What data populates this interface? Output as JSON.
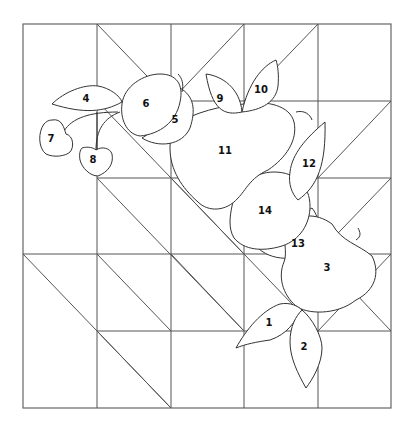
{
  "diagram": {
    "title": "",
    "type": "quilt-block applique pattern",
    "line_color": "#333333",
    "background": "#ffffff",
    "grid": {
      "columns": 5,
      "rows": 5,
      "x": [
        23,
        97,
        171,
        244,
        318,
        391
      ],
      "y": [
        24,
        101,
        178,
        254,
        331,
        408
      ]
    },
    "pieces": [
      {
        "id": "1",
        "label": "1",
        "name": "leaf",
        "x": 269,
        "y": 323
      },
      {
        "id": "2",
        "label": "2",
        "name": "leaf",
        "x": 304,
        "y": 347
      },
      {
        "id": "3",
        "label": "3",
        "name": "apple",
        "x": 327,
        "y": 268
      },
      {
        "id": "4",
        "label": "4",
        "name": "leaf",
        "x": 86,
        "y": 99
      },
      {
        "id": "5",
        "label": "5",
        "name": "plum-back",
        "x": 175,
        "y": 120
      },
      {
        "id": "6",
        "label": "6",
        "name": "plum",
        "x": 146,
        "y": 104
      },
      {
        "id": "7",
        "label": "7",
        "name": "cherry",
        "x": 51,
        "y": 139
      },
      {
        "id": "8",
        "label": "8",
        "name": "cherry",
        "x": 93,
        "y": 160
      },
      {
        "id": "9",
        "label": "9",
        "name": "leaf",
        "x": 220,
        "y": 99
      },
      {
        "id": "10",
        "label": "10",
        "name": "leaf",
        "x": 261,
        "y": 90
      },
      {
        "id": "11",
        "label": "11",
        "name": "pear",
        "x": 225,
        "y": 151
      },
      {
        "id": "12",
        "label": "12",
        "name": "leaf",
        "x": 309,
        "y": 164
      },
      {
        "id": "13",
        "label": "13",
        "name": "apple-back",
        "x": 298,
        "y": 244
      },
      {
        "id": "14",
        "label": "14",
        "name": "apple",
        "x": 265,
        "y": 211
      }
    ]
  }
}
